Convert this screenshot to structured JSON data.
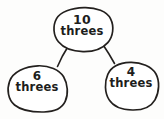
{
  "diagram": {
    "kind": "number-bond-branching-diagram",
    "style": "hand-drawn-pencil-sketch",
    "ink_color": "#23201e",
    "background_color": "#fdfdfc",
    "nodes": [
      {
        "id": "root",
        "number": "10",
        "word": "threes",
        "role": "total"
      },
      {
        "id": "left",
        "number": "6",
        "word": "threes",
        "role": "part"
      },
      {
        "id": "right",
        "number": "4",
        "word": "threes",
        "role": "part"
      }
    ],
    "connectors": [
      {
        "from": "root",
        "to": "left"
      },
      {
        "from": "root",
        "to": "right"
      }
    ]
  }
}
